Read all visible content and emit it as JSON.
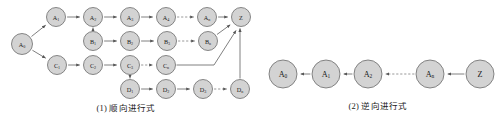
{
  "figure": {
    "background": "#ffffff",
    "node_fill": "#d3d3d3",
    "node_stroke": "#6b6b6b",
    "edge_color": "#555555"
  },
  "panels": [
    {
      "id": "forward",
      "caption": "(1) 顺向进行式",
      "nodes": [
        {
          "id": "A0",
          "label": "A",
          "sub": "0",
          "x": 22,
          "y": 44,
          "r": 10.5
        },
        {
          "id": "A1",
          "label": "A",
          "sub": "1",
          "x": 56,
          "y": 17,
          "r": 9.5
        },
        {
          "id": "A2",
          "label": "A",
          "sub": "2",
          "x": 93,
          "y": 17,
          "r": 9.5
        },
        {
          "id": "A3",
          "label": "A",
          "sub": "3",
          "x": 130,
          "y": 17,
          "r": 9.5
        },
        {
          "id": "A4",
          "label": "A",
          "sub": "4",
          "x": 166,
          "y": 17,
          "r": 9.5
        },
        {
          "id": "An",
          "label": "A",
          "sub": "n",
          "x": 207,
          "y": 17,
          "r": 9.5
        },
        {
          "id": "Z",
          "label": "Z",
          "sub": "",
          "x": 241,
          "y": 17,
          "r": 9.5
        },
        {
          "id": "B1",
          "label": "B",
          "sub": "1",
          "x": 93,
          "y": 41,
          "r": 9.5
        },
        {
          "id": "B2",
          "label": "B",
          "sub": "2",
          "x": 130,
          "y": 41,
          "r": 9.5
        },
        {
          "id": "B3",
          "label": "B",
          "sub": "3",
          "x": 167,
          "y": 41,
          "r": 9.5
        },
        {
          "id": "Bn",
          "label": "B",
          "sub": "n",
          "x": 208,
          "y": 41,
          "r": 9.5
        },
        {
          "id": "C1",
          "label": "C",
          "sub": "1",
          "x": 57,
          "y": 65,
          "r": 9.5
        },
        {
          "id": "C2",
          "label": "C",
          "sub": "2",
          "x": 93,
          "y": 65,
          "r": 9.5
        },
        {
          "id": "C3",
          "label": "C",
          "sub": "3",
          "x": 130,
          "y": 65,
          "r": 9.5
        },
        {
          "id": "Cn",
          "label": "C",
          "sub": "n",
          "x": 166,
          "y": 65,
          "r": 9.5
        },
        {
          "id": "D1",
          "label": "D",
          "sub": "1",
          "x": 130,
          "y": 89,
          "r": 9.5
        },
        {
          "id": "D2",
          "label": "D",
          "sub": "2",
          "x": 166,
          "y": 89,
          "r": 9.5
        },
        {
          "id": "D3",
          "label": "D",
          "sub": "3",
          "x": 203,
          "y": 89,
          "r": 9.5
        },
        {
          "id": "Dn",
          "label": "D",
          "sub": "n",
          "x": 240,
          "y": 89,
          "r": 9.5
        }
      ],
      "edges": [
        {
          "from": "A0",
          "to": "A1",
          "style": "solid"
        },
        {
          "from": "A0",
          "to": "C1",
          "style": "solid"
        },
        {
          "from": "A1",
          "to": "A2",
          "style": "solid"
        },
        {
          "from": "A2",
          "to": "A3",
          "style": "solid"
        },
        {
          "from": "A3",
          "to": "A4",
          "style": "solid"
        },
        {
          "from": "A4",
          "to": "An",
          "style": "dashed"
        },
        {
          "from": "An",
          "to": "Z",
          "style": "solid"
        },
        {
          "from": "A2",
          "to": "B1",
          "style": "solid"
        },
        {
          "from": "B1",
          "to": "B2",
          "style": "solid"
        },
        {
          "from": "B2",
          "to": "B3",
          "style": "solid"
        },
        {
          "from": "B3",
          "to": "Bn",
          "style": "dashed"
        },
        {
          "from": "Bn",
          "to": "Z",
          "style": "solid"
        },
        {
          "from": "C1",
          "to": "C2",
          "style": "solid"
        },
        {
          "from": "C2",
          "to": "C3",
          "style": "solid"
        },
        {
          "from": "C3",
          "to": "Cn",
          "style": "dashed"
        },
        {
          "from": "Cn",
          "to": "Z",
          "style": "solid"
        },
        {
          "from": "D1",
          "to": "C3",
          "style": "solid"
        },
        {
          "from": "D1",
          "to": "D2",
          "style": "solid"
        },
        {
          "from": "D2",
          "to": "D3",
          "style": "solid"
        },
        {
          "from": "D3",
          "to": "Dn",
          "style": "dashed"
        },
        {
          "from": "Dn",
          "to": "Z",
          "style": "solid"
        }
      ]
    },
    {
      "id": "backward",
      "caption": "(2) 逆向进行式",
      "nodes": [
        {
          "id": "A0",
          "label": "A",
          "sub": "0",
          "x": 31,
          "y": 74,
          "r": 14
        },
        {
          "id": "A1",
          "label": "A",
          "sub": "1",
          "x": 74,
          "y": 74,
          "r": 14
        },
        {
          "id": "A2",
          "label": "A",
          "sub": "2",
          "x": 116,
          "y": 74,
          "r": 14
        },
        {
          "id": "An",
          "label": "A",
          "sub": "n",
          "x": 178,
          "y": 74,
          "r": 14
        },
        {
          "id": "Z",
          "label": "Z",
          "sub": "",
          "x": 228,
          "y": 74,
          "r": 14
        }
      ],
      "edges": [
        {
          "from": "A1",
          "to": "A0",
          "style": "solid"
        },
        {
          "from": "A2",
          "to": "A1",
          "style": "solid"
        },
        {
          "from": "An",
          "to": "A2",
          "style": "dashed"
        },
        {
          "from": "Z",
          "to": "An",
          "style": "solid"
        }
      ]
    }
  ]
}
